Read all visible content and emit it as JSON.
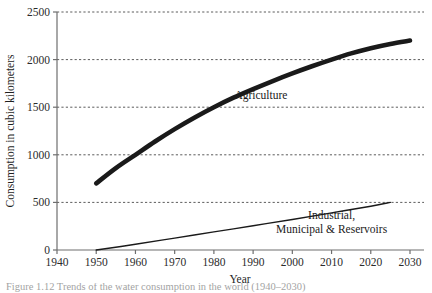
{
  "chart_data": {
    "type": "line",
    "title": "",
    "xlabel": "Year",
    "ylabel": "Consumption in cubic kilometers",
    "xlim": [
      1940,
      2030
    ],
    "ylim": [
      0,
      2500
    ],
    "xticks": [
      1940,
      1950,
      1960,
      1970,
      1980,
      1990,
      2000,
      2010,
      2020,
      2030
    ],
    "yticks": [
      0,
      500,
      1000,
      1500,
      2000,
      2500
    ],
    "grid": "horizontal-dashed",
    "legend_position": "inline-annotation",
    "series": [
      {
        "name": "Agriculture",
        "style": "thick-solid",
        "color": "#1a1a1a",
        "label_x": 1992,
        "label_y": 1590,
        "x": [
          1950,
          1955,
          1960,
          1965,
          1970,
          1975,
          1980,
          1985,
          1990,
          1995,
          2000,
          2005,
          2010,
          2015,
          2020,
          2025,
          2030
        ],
        "y": [
          700,
          860,
          1000,
          1140,
          1270,
          1390,
          1500,
          1600,
          1690,
          1775,
          1855,
          1930,
          2000,
          2065,
          2120,
          2165,
          2200
        ]
      },
      {
        "name": "Industrial, Municipal & Reservoirs",
        "style": "thin-solid",
        "color": "#1a1a1a",
        "label_line1": "Industrial,",
        "label_line2": "Municipal & Reservoirs",
        "label_x": 2010,
        "label_y": 330,
        "x": [
          1950,
          1960,
          1970,
          1980,
          1990,
          2000,
          2010,
          2020,
          2025
        ],
        "y": [
          0,
          60,
          125,
          190,
          255,
          320,
          390,
          460,
          500
        ]
      }
    ],
    "tick_label_texts": {
      "x": [
        "1940",
        "1950",
        "1960",
        "1970",
        "1980",
        "1990",
        "2000",
        "2010",
        "2020",
        "2030"
      ],
      "y": [
        "0",
        "500",
        "1000",
        "1500",
        "2000",
        "2500"
      ]
    }
  },
  "caption": {
    "text": "Figure 1.12  Trends of the water consumption in the world (1940–2030)"
  }
}
